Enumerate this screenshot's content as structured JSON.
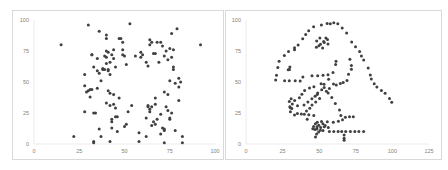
{
  "chart_data": [
    {
      "type": "scatter",
      "title": "",
      "xlabel": "",
      "ylabel": "",
      "xlim": [
        0,
        100
      ],
      "ylim": [
        0,
        100
      ],
      "xticks": [
        "0",
        "25",
        "50",
        "75",
        "100"
      ],
      "yticks": [
        "0",
        "25",
        "50",
        "75",
        "100"
      ],
      "grid": false,
      "marker_color": "#404040",
      "points": [
        [
          15,
          80
        ],
        [
          22,
          6
        ],
        [
          28,
          56
        ],
        [
          28,
          47
        ],
        [
          28,
          26
        ],
        [
          29,
          42
        ],
        [
          30,
          96
        ],
        [
          30,
          43
        ],
        [
          31,
          44
        ],
        [
          31,
          38
        ],
        [
          32,
          44
        ],
        [
          32,
          72
        ],
        [
          32,
          72
        ],
        [
          33,
          62
        ],
        [
          33,
          2
        ],
        [
          33,
          1
        ],
        [
          33,
          25
        ],
        [
          34,
          25
        ],
        [
          35,
          45
        ],
        [
          35,
          59
        ],
        [
          36,
          57
        ],
        [
          36,
          12
        ],
        [
          36,
          91
        ],
        [
          37,
          51
        ],
        [
          37,
          6
        ],
        [
          38,
          61
        ],
        [
          38,
          60
        ],
        [
          39,
          60
        ],
        [
          40,
          33
        ],
        [
          40,
          88
        ],
        [
          40,
          85
        ],
        [
          40,
          70
        ],
        [
          40,
          75
        ],
        [
          40,
          65
        ],
        [
          41,
          59
        ],
        [
          41,
          60
        ],
        [
          41,
          74
        ],
        [
          41,
          43
        ],
        [
          42,
          41
        ],
        [
          42,
          2
        ],
        [
          42,
          31
        ],
        [
          42,
          56
        ],
        [
          42,
          66
        ],
        [
          43,
          72
        ],
        [
          43,
          20
        ],
        [
          43,
          18
        ],
        [
          43,
          13
        ],
        [
          44,
          40
        ],
        [
          44,
          69
        ],
        [
          44,
          76
        ],
        [
          44,
          32
        ],
        [
          45,
          29
        ],
        [
          45,
          22
        ],
        [
          46,
          10
        ],
        [
          46,
          22
        ],
        [
          47,
          85
        ],
        [
          47,
          37
        ],
        [
          48,
          85
        ],
        [
          49,
          82
        ],
        [
          49,
          76
        ],
        [
          49,
          72
        ],
        [
          50,
          71
        ],
        [
          50,
          14
        ],
        [
          51,
          64
        ],
        [
          51,
          16
        ],
        [
          52,
          26
        ],
        [
          53,
          97
        ],
        [
          54,
          31
        ],
        [
          56,
          71
        ],
        [
          58,
          9
        ],
        [
          58,
          2
        ],
        [
          59,
          74
        ],
        [
          59,
          70
        ],
        [
          60,
          72
        ],
        [
          62,
          6
        ],
        [
          62,
          21
        ],
        [
          62,
          66
        ],
        [
          63,
          63
        ],
        [
          63,
          31
        ],
        [
          63,
          30
        ],
        [
          64,
          84
        ],
        [
          64,
          80
        ],
        [
          64,
          28
        ],
        [
          65,
          15
        ],
        [
          65,
          82
        ],
        [
          65,
          30
        ],
        [
          66,
          73
        ],
        [
          66,
          18
        ],
        [
          67,
          73
        ],
        [
          67,
          32
        ],
        [
          67,
          37
        ],
        [
          67,
          16
        ],
        [
          68,
          82
        ],
        [
          68,
          20
        ],
        [
          69,
          66
        ],
        [
          70,
          82
        ],
        [
          70,
          24
        ],
        [
          70,
          8
        ],
        [
          71,
          79
        ],
        [
          71,
          13
        ],
        [
          72,
          71
        ],
        [
          72,
          42
        ],
        [
          72,
          12
        ],
        [
          72,
          11
        ],
        [
          72,
          1
        ],
        [
          73,
          30
        ],
        [
          73,
          75
        ],
        [
          74,
          40
        ],
        [
          74,
          68
        ],
        [
          74,
          27
        ],
        [
          75,
          51
        ],
        [
          75,
          21
        ],
        [
          75,
          20
        ],
        [
          75,
          77
        ],
        [
          76,
          70
        ],
        [
          76,
          25
        ],
        [
          76,
          89
        ],
        [
          77,
          76
        ],
        [
          77,
          60
        ],
        [
          77,
          62
        ],
        [
          78,
          11
        ],
        [
          78,
          49
        ],
        [
          79,
          93
        ],
        [
          80,
          53
        ],
        [
          80,
          46
        ],
        [
          80,
          35
        ],
        [
          81,
          50
        ],
        [
          82,
          6
        ],
        [
          82,
          1
        ],
        [
          92,
          80
        ],
        [
          35,
          69
        ],
        [
          45,
          62
        ],
        [
          39,
          71
        ],
        [
          64,
          26
        ]
      ]
    },
    {
      "type": "scatter",
      "title": "",
      "xlabel": "",
      "ylabel": "",
      "xlim": [
        0,
        125
      ],
      "ylim": [
        0,
        100
      ],
      "xticks": [
        "0",
        "25",
        "50",
        "75",
        "100",
        "125"
      ],
      "yticks": [
        "0",
        "25",
        "50",
        "75",
        "100"
      ],
      "grid": false,
      "marker_color": "#404040",
      "points": [
        [
          55.4,
          97.2
        ],
        [
          51.5,
          96.0
        ],
        [
          46.2,
          94.5
        ],
        [
          42.8,
          91.4
        ],
        [
          40.8,
          88.3
        ],
        [
          38.7,
          84.9
        ],
        [
          35.6,
          79.9
        ],
        [
          33.1,
          77.6
        ],
        [
          29.0,
          74.5
        ],
        [
          26.2,
          71.4
        ],
        [
          20.8,
          55.4
        ],
        [
          20.3,
          51.5
        ],
        [
          22.6,
          66.7
        ],
        [
          21.7,
          61.8
        ],
        [
          26.4,
          51.0
        ],
        [
          29.6,
          51.0
        ],
        [
          33.6,
          51.0
        ],
        [
          37.0,
          50.9
        ],
        [
          38.9,
          54.0
        ],
        [
          45.1,
          55.1
        ],
        [
          49.0,
          55.1
        ],
        [
          52.6,
          55.5
        ],
        [
          56.0,
          55.9
        ],
        [
          59.4,
          57.6
        ],
        [
          61.2,
          64.0
        ],
        [
          61.5,
          66.7
        ],
        [
          56.4,
          52.2
        ],
        [
          53.3,
          48.2
        ],
        [
          51.7,
          43.7
        ],
        [
          49.0,
          41.1
        ],
        [
          47.2,
          38.5
        ],
        [
          45.0,
          36.5
        ],
        [
          42.3,
          33.9
        ],
        [
          39.6,
          31.4
        ],
        [
          35.2,
          30.9
        ],
        [
          31.6,
          32.3
        ],
        [
          30.3,
          29.2
        ],
        [
          29.9,
          30.0
        ],
        [
          29.6,
          34.3
        ],
        [
          30.8,
          36.5
        ],
        [
          33.2,
          35.2
        ],
        [
          36.5,
          37.3
        ],
        [
          38.2,
          40.1
        ],
        [
          40.0,
          43.1
        ],
        [
          43.4,
          45.2
        ],
        [
          46.4,
          46.1
        ],
        [
          51.3,
          48.6
        ],
        [
          53.4,
          45.5
        ],
        [
          57.0,
          44.8
        ],
        [
          59.8,
          48.4
        ],
        [
          61.7,
          47.5
        ],
        [
          64.4,
          48.8
        ],
        [
          66.4,
          49.6
        ],
        [
          69.0,
          51.2
        ],
        [
          70.0,
          56.3
        ],
        [
          72.0,
          60.3
        ],
        [
          72.0,
          63.3
        ],
        [
          71.0,
          68.4
        ],
        [
          72.2,
          82.3
        ],
        [
          74.8,
          78.5
        ],
        [
          77.6,
          74.6
        ],
        [
          78.8,
          70.9
        ],
        [
          80.4,
          67.7
        ],
        [
          83.5,
          61.2
        ],
        [
          84.9,
          55.7
        ],
        [
          85.6,
          52.4
        ],
        [
          87.6,
          48.6
        ],
        [
          89.4,
          45.9
        ],
        [
          92.5,
          43.1
        ],
        [
          95.0,
          40.9
        ],
        [
          98.0,
          36.8
        ],
        [
          99.5,
          33.6
        ],
        [
          68.7,
          89.6
        ],
        [
          65.7,
          93.5
        ],
        [
          62.7,
          96.9
        ],
        [
          60.0,
          97.8
        ],
        [
          57.6,
          96.9
        ],
        [
          33.1,
          23.5
        ],
        [
          35.1,
          24.5
        ],
        [
          37.8,
          24.2
        ],
        [
          39.8,
          24.0
        ],
        [
          42.9,
          23.6
        ],
        [
          46.3,
          23.0
        ],
        [
          41.8,
          19.9
        ],
        [
          30.3,
          26.0
        ],
        [
          31.3,
          28.7
        ],
        [
          41.3,
          26.5
        ],
        [
          43.6,
          28.9
        ],
        [
          45.1,
          31.4
        ],
        [
          47.6,
          33.9
        ],
        [
          50.3,
          36.7
        ],
        [
          54.9,
          42.5
        ],
        [
          56.1,
          41.1
        ],
        [
          58.6,
          37.5
        ],
        [
          61.0,
          32.6
        ],
        [
          63.9,
          27.5
        ],
        [
          64.8,
          23.0
        ],
        [
          65.9,
          19.6
        ],
        [
          67.9,
          21.6
        ],
        [
          70.7,
          21.9
        ],
        [
          73.3,
          21.9
        ],
        [
          63.1,
          18.4
        ],
        [
          59.6,
          17.6
        ],
        [
          55.5,
          17.9
        ],
        [
          51.6,
          18.1
        ],
        [
          48.7,
          17.6
        ],
        [
          47.4,
          16.3
        ],
        [
          46.2,
          14.0
        ],
        [
          45.6,
          12.3
        ],
        [
          47.1,
          11.6
        ],
        [
          48.5,
          12.1
        ],
        [
          51.0,
          13.4
        ],
        [
          53.5,
          13.9
        ],
        [
          56.2,
          13.3
        ],
        [
          57.0,
          10.0
        ],
        [
          60.0,
          10.0
        ],
        [
          62.9,
          10.0
        ],
        [
          65.4,
          10.0
        ],
        [
          68.1,
          10.0
        ],
        [
          71.3,
          10.0
        ],
        [
          74.3,
          10.0
        ],
        [
          77.1,
          10.0
        ],
        [
          80.3,
          10.0
        ],
        [
          67.0,
          7.2
        ],
        [
          67.0,
          4.6
        ],
        [
          67.0,
          3.1
        ],
        [
          48.2,
          8.0
        ],
        [
          49.6,
          9.7
        ],
        [
          50.8,
          11.1
        ],
        [
          52.6,
          11.0
        ],
        [
          47.5,
          5.6
        ],
        [
          48.5,
          13.9
        ],
        [
          49.7,
          15.2
        ],
        [
          52.5,
          16.3
        ],
        [
          54.0,
          14.8
        ],
        [
          48.6,
          40.0
        ],
        [
          33.1,
          76.0
        ],
        [
          29.7,
          60.0
        ],
        [
          30.0,
          62.0
        ],
        [
          28.8,
          59.8
        ],
        [
          48.3,
          83.1
        ],
        [
          50.5,
          85.5
        ],
        [
          53.1,
          82.6
        ],
        [
          54.6,
          85.6
        ],
        [
          55.7,
          84.3
        ],
        [
          56.0,
          80.6
        ],
        [
          53.4,
          81.8
        ],
        [
          50.9,
          80.4
        ],
        [
          48.1,
          78.1
        ],
        [
          49.8,
          79.2
        ],
        [
          52.3,
          77.4
        ]
      ]
    }
  ]
}
